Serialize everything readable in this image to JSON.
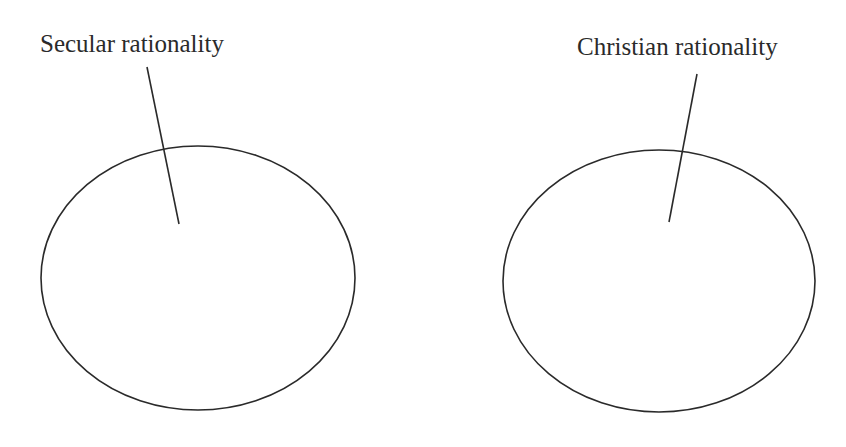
{
  "diagram": {
    "stroke_color": "#2a2a2a",
    "background": "#ffffff",
    "nodes": [
      {
        "id": "secular",
        "label": "Secular rationality",
        "ellipse": {
          "cx": 198,
          "cy": 278,
          "rx": 157,
          "ry": 132
        },
        "label_pos": {
          "x": 40,
          "y": 52
        },
        "leader": {
          "x1": 147,
          "y1": 67,
          "x2": 179,
          "y2": 224
        }
      },
      {
        "id": "christian",
        "label": "Christian rationality",
        "ellipse": {
          "cx": 659,
          "cy": 281,
          "rx": 156,
          "ry": 131
        },
        "label_pos": {
          "x": 577,
          "y": 55
        },
        "leader": {
          "x1": 697,
          "y1": 74,
          "x2": 669,
          "y2": 222
        }
      }
    ]
  }
}
